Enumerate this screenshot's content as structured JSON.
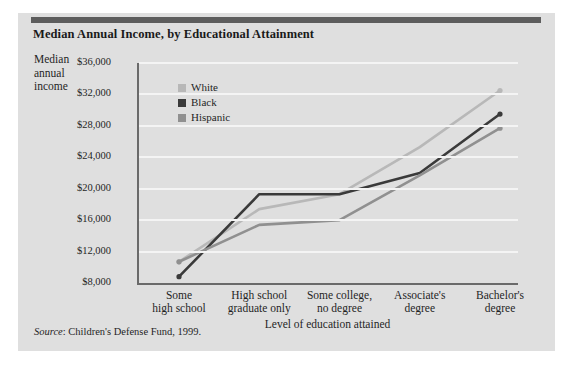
{
  "title": "Median Annual Income, by Educational Attainment",
  "axis": {
    "y_label_line1": "Median",
    "y_label_line2": "annual",
    "y_label_line3": "income",
    "x_title": "Level of education attained"
  },
  "legend": [
    {
      "label": "White",
      "color": "#b8b8b8"
    },
    {
      "label": "Black",
      "color": "#3a3a3a"
    },
    {
      "label": "Hispanic",
      "color": "#909090"
    }
  ],
  "source": {
    "prefix": "Source",
    "text": ": Children's Defense Fund, 1999."
  },
  "chart_data": {
    "type": "line",
    "title": "Median Annual Income, by Educational Attainment",
    "xlabel": "Level of education attained",
    "ylabel": "Median annual income",
    "categories": [
      "Some high school",
      "High school graduate only",
      "Some college, no degree",
      "Associate's degree",
      "Bachelor's degree"
    ],
    "category_lines": [
      [
        "Some",
        "high school"
      ],
      [
        "High school",
        "graduate only"
      ],
      [
        "Some college,",
        "no degree"
      ],
      [
        "Associate's",
        "degree"
      ],
      [
        "Bachelor's",
        "degree"
      ]
    ],
    "ytick_labels": [
      "$36,000",
      "$32,000",
      "$28,000",
      "$24,000",
      "$20,000",
      "$16,000",
      "$12,000",
      "$8,000"
    ],
    "ytick_values": [
      36000,
      32000,
      28000,
      24000,
      20000,
      16000,
      12000,
      8000
    ],
    "ylim": [
      8000,
      36000
    ],
    "grid": true,
    "legend_position": "upper-left-inside",
    "series": [
      {
        "name": "White",
        "color": "#b8b8b8",
        "values": [
          10700,
          17400,
          19300,
          25300,
          32500
        ]
      },
      {
        "name": "Black",
        "color": "#3a3a3a",
        "values": [
          8800,
          19300,
          19300,
          22000,
          29500
        ]
      },
      {
        "name": "Hispanic",
        "color": "#909090",
        "values": [
          10700,
          15400,
          16000,
          21700,
          27700
        ]
      }
    ]
  }
}
